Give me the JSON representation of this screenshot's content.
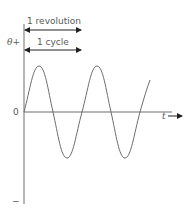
{
  "diagram": {
    "type": "sine-wave",
    "y_axis": {
      "label_top": "θ+",
      "label_bottom": "−",
      "origin_label": "0"
    },
    "x_axis": {
      "label": "t"
    },
    "annotations": [
      {
        "text": "1 revolution",
        "span": "one period"
      },
      {
        "text": "1 cycle",
        "span": "one period"
      }
    ],
    "wave": {
      "cycles_shown": 2.5,
      "start_phase": "rising from zero"
    },
    "colors": {
      "line": "#6e6e6e",
      "text": "#5a5a5a",
      "arrow": "#222222"
    }
  }
}
